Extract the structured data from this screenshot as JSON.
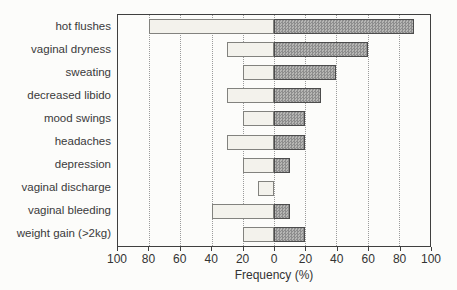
{
  "chart_data": {
    "type": "bar",
    "variant": "horizontal-diverging",
    "title": "",
    "xlabel": "Frequency (%)",
    "ylabel": "",
    "categories": [
      "hot flushes",
      "vaginal dryness",
      "sweating",
      "decreased libido",
      "mood swings",
      "headaches",
      "depression",
      "vaginal discharge",
      "vaginal bleeding",
      "weight gain (>2kg)"
    ],
    "series": [
      {
        "name": "left-group",
        "side": "left",
        "style": "light-plain",
        "values": [
          80,
          30,
          20,
          30,
          20,
          30,
          20,
          10,
          40,
          20
        ]
      },
      {
        "name": "right-group",
        "side": "right",
        "style": "dark-hatched",
        "values": [
          90,
          60,
          40,
          30,
          20,
          20,
          10,
          0,
          10,
          20
        ]
      }
    ],
    "axis_tick_labels": [
      "100",
      "80",
      "60",
      "40",
      "20",
      "0",
      "20",
      "40",
      "60",
      "80",
      "100"
    ],
    "xlim_each_side": [
      0,
      100
    ],
    "tick_step": 20,
    "grid": "dotted-vertical",
    "legend": "none"
  },
  "colors": {
    "background": "#fcfcfa",
    "plot_border": "#3f3f3f",
    "gridline": "#9b9b9b",
    "light_bar_fill": "#f3f2ec",
    "light_bar_border": "#82827e",
    "dark_bar_fill": "#9b9b9b",
    "dark_bar_border": "#4c4c4c",
    "text": "#333333"
  }
}
